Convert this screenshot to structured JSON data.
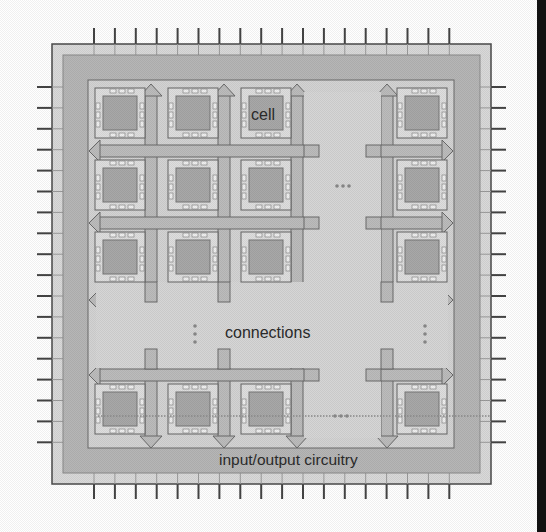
{
  "diagram": {
    "type": "chip-layout",
    "labels": {
      "cell": "cell",
      "connections": "connections",
      "io": "input/output circuitry"
    },
    "ellipsis": {
      "horizontal": "...",
      "vertical": "⋮"
    },
    "grid": {
      "visible_columns": 4,
      "visible_rows": 4,
      "hidden_column_index": 3,
      "hidden_row_index": 3
    },
    "pins": {
      "top": 18,
      "bottom": 18,
      "left": 18,
      "right": 18
    },
    "colors": {
      "background": "#ffffff",
      "outer_ring": "#d8d8d8",
      "io_ring": "#b4b4b4",
      "core": "#d2d2d2",
      "cell_frame": "#dedede",
      "cell_body": "#a8a8a8",
      "channel": "#bcbcbc",
      "outline": "#555555",
      "pin": "#444444",
      "edge_bar": "#111111"
    }
  }
}
